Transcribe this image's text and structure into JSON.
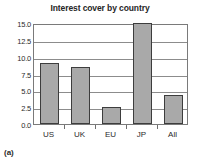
{
  "chart_data": {
    "type": "bar",
    "title": "Interest cover by country",
    "xlabel": "",
    "ylabel": "",
    "categories": [
      "US",
      "UK",
      "EU",
      "JP",
      "All"
    ],
    "values": [
      9.1,
      8.5,
      2.5,
      15.0,
      4.3
    ],
    "ylim": [
      0.0,
      15.0
    ],
    "yticks": [
      "0.0",
      "2.5",
      "5.0",
      "7.5",
      "10.0",
      "12.5",
      "15.0"
    ],
    "ytick_values": [
      0.0,
      2.5,
      5.0,
      7.5,
      10.0,
      12.5,
      15.0
    ],
    "grid": true,
    "legend": null,
    "bar_fill_color": "#a9a9a9",
    "bar_edge_color": "#3d3d3d",
    "frame_color": "#7a7a7a"
  },
  "figure": {
    "panel_caption": "(a)"
  }
}
